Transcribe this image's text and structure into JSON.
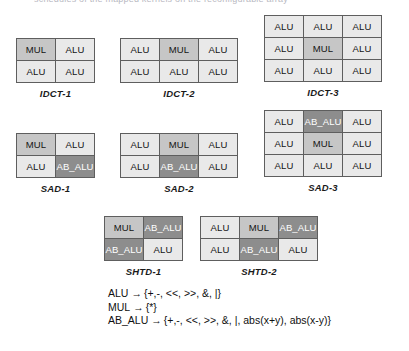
{
  "figure": {
    "top_fragment": "schedules of the mapped kernels on the reconfigurable array",
    "cell_types": {
      "alu": "ALU",
      "mul": "MUL",
      "ab_alu": "AB_ALU"
    },
    "colors": {
      "alu_fill": "#e9e9e9",
      "mul_fill": "#c6c6c6",
      "ab_alu_fill": "#8d8d8d",
      "ab_alu_text": "#ffffff",
      "border": "#5e5e5e",
      "text": "#141414",
      "background": "#ffffff"
    },
    "groups": [
      {
        "id": "idct-1",
        "caption": "IDCT-1",
        "cols": 2,
        "rows": 2,
        "cells": [
          {
            "label": "MUL",
            "type": "mul"
          },
          {
            "label": "ALU",
            "type": "alu"
          },
          {
            "label": "ALU",
            "type": "alu"
          },
          {
            "label": "ALU",
            "type": "alu"
          }
        ]
      },
      {
        "id": "idct-2",
        "caption": "IDCT-2",
        "cols": 3,
        "rows": 2,
        "cells": [
          {
            "label": "ALU",
            "type": "alu"
          },
          {
            "label": "MUL",
            "type": "mul"
          },
          {
            "label": "ALU",
            "type": "alu"
          },
          {
            "label": "ALU",
            "type": "alu"
          },
          {
            "label": "ALU",
            "type": "alu"
          },
          {
            "label": "ALU",
            "type": "alu"
          }
        ]
      },
      {
        "id": "idct-3",
        "caption": "IDCT-3",
        "cols": 3,
        "rows": 3,
        "cells": [
          {
            "label": "ALU",
            "type": "alu"
          },
          {
            "label": "ALU",
            "type": "alu"
          },
          {
            "label": "ALU",
            "type": "alu"
          },
          {
            "label": "ALU",
            "type": "alu"
          },
          {
            "label": "MUL",
            "type": "mul"
          },
          {
            "label": "ALU",
            "type": "alu"
          },
          {
            "label": "ALU",
            "type": "alu"
          },
          {
            "label": "ALU",
            "type": "alu"
          },
          {
            "label": "ALU",
            "type": "alu"
          }
        ]
      },
      {
        "id": "sad-1",
        "caption": "SAD-1",
        "cols": 2,
        "rows": 2,
        "cells": [
          {
            "label": "MUL",
            "type": "mul"
          },
          {
            "label": "ALU",
            "type": "alu"
          },
          {
            "label": "ALU",
            "type": "alu"
          },
          {
            "label": "AB_ALU",
            "type": "ab"
          }
        ]
      },
      {
        "id": "sad-2",
        "caption": "SAD-2",
        "cols": 3,
        "rows": 2,
        "cells": [
          {
            "label": "ALU",
            "type": "alu"
          },
          {
            "label": "MUL",
            "type": "mul"
          },
          {
            "label": "ALU",
            "type": "alu"
          },
          {
            "label": "ALU",
            "type": "alu"
          },
          {
            "label": "AB_ALU",
            "type": "ab"
          },
          {
            "label": "ALU",
            "type": "alu"
          }
        ]
      },
      {
        "id": "sad-3",
        "caption": "SAD-3",
        "cols": 3,
        "rows": 3,
        "cells": [
          {
            "label": "ALU",
            "type": "alu"
          },
          {
            "label": "AB_ALU",
            "type": "ab"
          },
          {
            "label": "ALU",
            "type": "alu"
          },
          {
            "label": "ALU",
            "type": "alu"
          },
          {
            "label": "MUL",
            "type": "mul"
          },
          {
            "label": "ALU",
            "type": "alu"
          },
          {
            "label": "ALU",
            "type": "alu"
          },
          {
            "label": "ALU",
            "type": "alu"
          },
          {
            "label": "ALU",
            "type": "alu"
          }
        ]
      },
      {
        "id": "shtd-1",
        "caption": "SHTD-1",
        "cols": 2,
        "rows": 2,
        "cells": [
          {
            "label": "MUL",
            "type": "mul"
          },
          {
            "label": "AB_ALU",
            "type": "ab"
          },
          {
            "label": "AB_ALU",
            "type": "ab"
          },
          {
            "label": "ALU",
            "type": "alu"
          }
        ]
      },
      {
        "id": "shtd-2",
        "caption": "SHTD-2",
        "cols": 3,
        "rows": 2,
        "cells": [
          {
            "label": "ALU",
            "type": "alu"
          },
          {
            "label": "MUL",
            "type": "mul"
          },
          {
            "label": "AB_ALU",
            "type": "ab"
          },
          {
            "label": "ALU",
            "type": "alu"
          },
          {
            "label": "AB_ALU",
            "type": "ab"
          },
          {
            "label": "ALU",
            "type": "alu"
          }
        ]
      }
    ],
    "legend": [
      {
        "name": "ALU",
        "arrow": "→",
        "ops": "{+,-, <<, >>, &, |}"
      },
      {
        "name": "MUL",
        "arrow": "→",
        "ops": "{*}"
      },
      {
        "name": "AB_ALU",
        "arrow": "→",
        "ops": "{+,-, <<, >>, &, |, abs(x+y), abs(x-y)}"
      }
    ]
  }
}
